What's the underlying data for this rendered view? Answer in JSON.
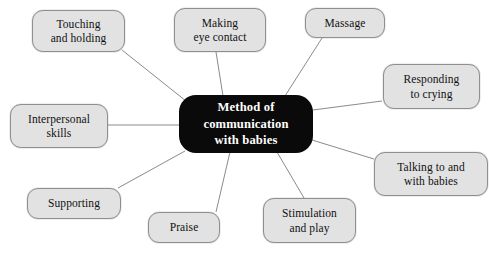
{
  "diagram": {
    "type": "mind-map",
    "title": "Method of communication with babies",
    "canvas": {
      "width": 489,
      "height": 256
    },
    "colors": {
      "background": "#ffffff",
      "center_fill": "#0a0a0a",
      "center_text": "#ffffff",
      "node_fill": "#e2e2e2",
      "node_border": "#8f8f8f",
      "node_text": "#111111",
      "connector": "#8a8a8a"
    },
    "center": {
      "label": "Method of\ncommunication\nwith babies",
      "x": 179,
      "y": 95,
      "width": 134,
      "height": 58
    },
    "nodes": [
      {
        "id": "touching-and-holding",
        "label": "Touching\nand holding",
        "x": 32,
        "y": 10,
        "width": 93,
        "height": 42,
        "anchor": {
          "x": 122,
          "y": 50
        },
        "center_point": {
          "x": 186,
          "y": 101
        }
      },
      {
        "id": "making-eye-contact",
        "label": "Making\neye contact",
        "x": 174,
        "y": 8,
        "width": 92,
        "height": 44,
        "anchor": {
          "x": 216,
          "y": 52
        },
        "center_point": {
          "x": 223,
          "y": 96
        }
      },
      {
        "id": "massage",
        "label": "Massage",
        "x": 305,
        "y": 8,
        "width": 80,
        "height": 30,
        "anchor": {
          "x": 322,
          "y": 38
        },
        "center_point": {
          "x": 285,
          "y": 96
        }
      },
      {
        "id": "responding-to-crying",
        "label": "Responding\nto crying",
        "x": 383,
        "y": 64,
        "width": 97,
        "height": 45,
        "anchor": {
          "x": 382,
          "y": 101
        },
        "center_point": {
          "x": 313,
          "y": 110
        }
      },
      {
        "id": "talking-to-and-with-babies",
        "label": "Talking to and\nwith babies",
        "x": 374,
        "y": 152,
        "width": 114,
        "height": 44,
        "anchor": {
          "x": 374,
          "y": 159
        },
        "center_point": {
          "x": 312,
          "y": 140
        }
      },
      {
        "id": "stimulation-and-play",
        "label": "Stimulation\nand play",
        "x": 263,
        "y": 198,
        "width": 93,
        "height": 45,
        "anchor": {
          "x": 304,
          "y": 198
        },
        "center_point": {
          "x": 277,
          "y": 152
        }
      },
      {
        "id": "praise",
        "label": "Praise",
        "x": 148,
        "y": 212,
        "width": 72,
        "height": 31,
        "anchor": {
          "x": 216,
          "y": 212
        },
        "center_point": {
          "x": 230,
          "y": 152
        }
      },
      {
        "id": "supporting",
        "label": "Supporting",
        "x": 27,
        "y": 188,
        "width": 94,
        "height": 31,
        "anchor": {
          "x": 118,
          "y": 188
        },
        "center_point": {
          "x": 185,
          "y": 151
        }
      },
      {
        "id": "interpersonal-skills",
        "label": "Interpersonal\nskills",
        "x": 10,
        "y": 104,
        "width": 98,
        "height": 44,
        "anchor": {
          "x": 108,
          "y": 125
        },
        "center_point": {
          "x": 179,
          "y": 125
        }
      }
    ]
  }
}
